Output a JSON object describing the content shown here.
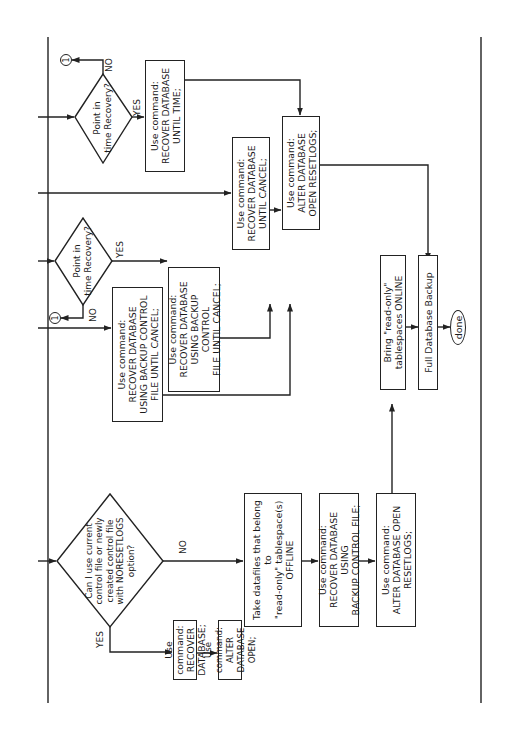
{
  "diagram": {
    "type": "flowchart",
    "orientation": "rotated 90 degrees counter-clockwise",
    "nodes": {
      "d_main": "Can I use current\ncontrol file or newly\ncreated control file\nwith NORESETLOGS\noption?",
      "b_recover_db": "Use command:\nRECOVER DATABASE;",
      "b_alter_open": "Use command:\nALTER DATABASE OPEN;",
      "b_offline": "Take datafiles that belong to\n\"read-only\" tablespace(s)\nOFFLINE",
      "b_recover_backup_cf": "Use command:\nRECOVER DATABASE USING\nBACKUP CONTROL FILE;",
      "b_alter_resetlogs_low": "Use command:\nALTER DATABASE OPEN\nRESETLOGS;",
      "b_online": "Bring \"read-only\"\ntablespaces ONLINE",
      "b_full_backup": "Full Database Backup",
      "t_done": "done",
      "b_recover_bcf_cancel_1": "Use command:\nRECOVER DATABASE\nUSING BACKUP CONTROL\nFILE UNTIL CANCEL;",
      "d_pitr_1": "Point in\ntime Recovery?",
      "b_recover_bcf_cancel_2": "Use command:\nRECOVER DATABASE\nUSING BACKUP CONTROL\nFILE UNTIL CANCEL;",
      "b_recover_until_cancel": "Use command:\nRECOVER DATABASE\nUNTIL CANCEL;",
      "b_alter_resetlogs_top": "Use command:\nALTER DATABASE\nOPEN RESETLOGS;",
      "d_pitr_2": "Point in\ntime Recovery?",
      "b_recover_until_time": "Use command:\nRECOVER DATABASE\nUNTIL TIME;"
    },
    "labels": {
      "yes": "YES",
      "no": "NO",
      "connector": "1"
    },
    "edges": [
      [
        "d_main",
        "b_recover_db",
        "YES"
      ],
      [
        "b_recover_db",
        "b_alter_open",
        ""
      ],
      [
        "d_main",
        "b_offline",
        "NO"
      ],
      [
        "b_offline",
        "b_recover_backup_cf",
        ""
      ],
      [
        "b_recover_backup_cf",
        "b_alter_resetlogs_low",
        ""
      ],
      [
        "b_alter_resetlogs_low",
        "b_online",
        ""
      ],
      [
        "b_online",
        "b_full_backup",
        ""
      ],
      [
        "b_full_backup",
        "t_done",
        ""
      ],
      [
        "d_pitr_1",
        "b_recover_bcf_cancel_2",
        "YES"
      ],
      [
        "d_pitr_1",
        "connector_1",
        "NO"
      ],
      [
        "b_recover_bcf_cancel_1",
        "b_alter_resetlogs_top",
        ""
      ],
      [
        "b_recover_bcf_cancel_2",
        "b_alter_resetlogs_top",
        ""
      ],
      [
        "b_recover_until_cancel",
        "b_alter_resetlogs_top",
        ""
      ],
      [
        "d_pitr_2",
        "b_recover_until_time",
        "YES"
      ],
      [
        "d_pitr_2",
        "connector_1",
        "NO"
      ],
      [
        "b_recover_until_time",
        "b_alter_resetlogs_top",
        ""
      ],
      [
        "b_alter_resetlogs_top",
        "b_full_backup",
        ""
      ]
    ]
  }
}
